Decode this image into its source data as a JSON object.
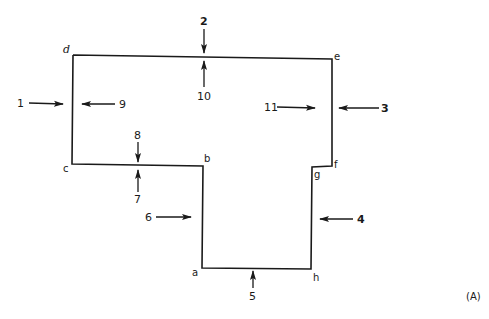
{
  "figure": {
    "label": "(A)",
    "outline_color": "#1a1a1a",
    "background": "#ffffff"
  },
  "corners": {
    "a": "a",
    "b": "b",
    "c": "c",
    "d": "d",
    "e": "e",
    "f": "f",
    "g": "g",
    "h": "h"
  },
  "arrows": {
    "1": "1",
    "2": "2",
    "3": "3",
    "4": "4",
    "5": "5",
    "6": "6",
    "7": "7",
    "8": "8",
    "9": "9",
    "10": "10",
    "11": "11"
  }
}
